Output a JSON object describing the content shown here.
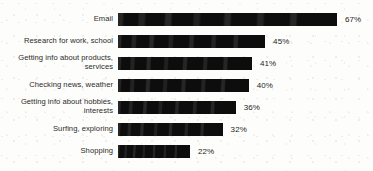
{
  "chart_data": {
    "type": "bar",
    "orientation": "horizontal",
    "title": "",
    "subtitle": "",
    "xlabel": "",
    "ylabel": "",
    "xlim": [
      0,
      67
    ],
    "grid": false,
    "legend": null,
    "value_suffix": "%",
    "bar_color": "#0d0d0d",
    "background_color": "#fdfdfb",
    "label_color": "#2b2b2b",
    "categories": [
      "Email",
      "Research for work, school",
      "Getting info about products,\nservices",
      "Checking news, weather",
      "Getting info about hobbies,\ninterests",
      "Surfing, exploring",
      "Shopping"
    ],
    "values": [
      67,
      45,
      41,
      40,
      36,
      32,
      22
    ],
    "value_labels": [
      "67%",
      "45%",
      "41%",
      "40%",
      "36%",
      "32%",
      "22%"
    ]
  }
}
